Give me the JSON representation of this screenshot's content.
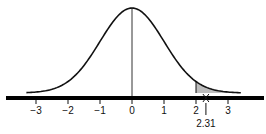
{
  "chart_data": {
    "type": "area",
    "xlabel": "",
    "ylabel": "",
    "x_ticks": [
      -3,
      -2,
      -1,
      0,
      1,
      2,
      3
    ],
    "x_tick_labels": [
      "−3",
      "−2",
      "−1",
      "0",
      "1",
      "2",
      "3"
    ],
    "xlim": [
      -3.3,
      3.4
    ],
    "mean": 0,
    "sd": 1,
    "shaded_region": {
      "from": 2.0,
      "to": 3.4,
      "color": "#bdbdbd"
    },
    "annotation": {
      "x": 2.31,
      "label": "2.31"
    },
    "grid": false,
    "legend": false
  },
  "colors": {
    "curve": "#111111",
    "axis": "#000000",
    "shade": "#bdbdbd"
  }
}
